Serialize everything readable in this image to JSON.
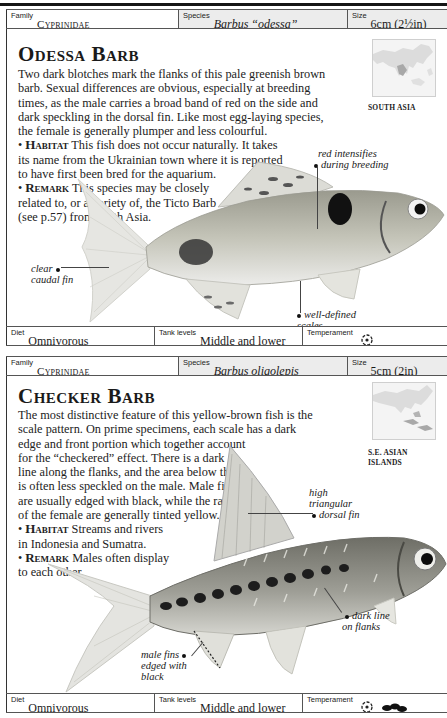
{
  "page": {
    "entries": [
      {
        "family": {
          "label": "Family",
          "value": "Cyprinidae"
        },
        "species": {
          "label": "Species",
          "value": "Barbus “odessa”"
        },
        "size": {
          "label": "Size",
          "value": "6cm (2½in)"
        },
        "title": "Odessa Barb",
        "description": [
          "Two dark blotches mark the flanks of this pale greenish brown",
          "barb. Sexual differences are obvious, especially at breeding",
          "times, as the male carries a broad band of red on the side and",
          "dark speckling in the dorsal fin. Like most egg-laying species,",
          "the female is generally plumper and less colourful."
        ],
        "habitat": {
          "keyword": "Habitat",
          "lines": [
            "This fish does not occur naturally. It takes",
            "its name from the Ukrainian town where it is reported",
            "to have first been bred for the aquarium."
          ]
        },
        "remark": {
          "keyword": "Remark",
          "lines": [
            "This species may be closely",
            "related to, or a variety of, the Ticto Barb",
            "(see p.57) from south Asia."
          ]
        },
        "map": {
          "region_label": "SOUTH ASIA",
          "icon": "map-south-asia-icon"
        },
        "callouts": {
          "red": [
            "red intensifies",
            "during breeding"
          ],
          "caudal": [
            "clear",
            "caudal fin"
          ],
          "scales": [
            "well-defined",
            "scales"
          ]
        },
        "footer": {
          "diet": {
            "label": "Diet",
            "value": "Omnivorous"
          },
          "tank_levels": {
            "label": "Tank levels",
            "value": "Middle and lower"
          },
          "temperament": {
            "label": "Temperament",
            "icons": [
              "peaceful-fish-icon"
            ]
          }
        }
      },
      {
        "family": {
          "label": "Family",
          "value": "Cyprinidae"
        },
        "species": {
          "label": "Species",
          "value": "Barbus oligolepis"
        },
        "size": {
          "label": "Size",
          "value": "5cm (2in)"
        },
        "title": "Checker Barb",
        "description": [
          "The most distinctive feature of this yellow-brown fish is the",
          "scale pattern. On prime specimens, each scale has a dark",
          "edge and front portion which together account",
          "for the “checkered” effect. There is a dark",
          "line along the flanks, and the area below this",
          "is often less speckled on the male. Male fins",
          "are usually edged with black, while the rays",
          "of the female are generally tinted yellow."
        ],
        "habitat": {
          "keyword": "Habitat",
          "lines": [
            "Streams and rivers",
            "in Indonesia and Sumatra."
          ]
        },
        "remark": {
          "keyword": "Remark",
          "lines": [
            "Males often display",
            "to each other."
          ]
        },
        "map": {
          "region_label_lines": [
            "S.E. ASIAN",
            "ISLANDS"
          ],
          "icon": "map-se-asia-icon"
        },
        "callouts": {
          "dorsal": [
            "high",
            "triangular",
            "dorsal fin"
          ],
          "flanks": [
            "dark line",
            "on flanks"
          ],
          "male_fins": [
            "male fins",
            "edged with",
            "black"
          ]
        },
        "footer": {
          "diet": {
            "label": "Diet",
            "value": "Omnivorous"
          },
          "tank_levels": {
            "label": "Tank levels",
            "value": "Middle and lower"
          },
          "temperament": {
            "label": "Temperament",
            "icons": [
              "peaceful-fish-icon",
              "shoal-fish-icon"
            ]
          }
        }
      }
    ]
  },
  "colors": {
    "rule": "#151515",
    "border": "#555555",
    "species_shade": "#ececec",
    "text": "#1c1c1c"
  }
}
